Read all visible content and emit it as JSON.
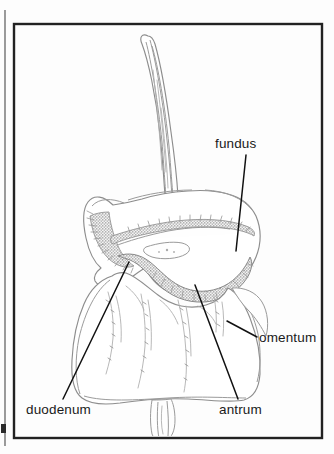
{
  "figure": {
    "style": "pen-and-ink medical illustration",
    "background_color": "#fdfdfd",
    "ink_color": "#8d8d8d",
    "label_color": "#1a1a1a",
    "frame_color": "#222222"
  },
  "frame": {
    "x": 14,
    "y": 24,
    "width": 308,
    "height": 414,
    "stroke_width": 2.4,
    "margin_rule_x": 5
  },
  "labels": [
    {
      "id": "fundus",
      "text": "fundus",
      "text_x": 215,
      "text_y": 148,
      "anchor": "start",
      "leader": {
        "x1": 246,
        "y1": 155,
        "x2": 236,
        "y2": 251
      }
    },
    {
      "id": "omentum",
      "text": "omentum",
      "text_x": 259,
      "text_y": 342,
      "anchor": "start",
      "leader": {
        "x1": 227,
        "y1": 321,
        "x2": 257,
        "y2": 337
      }
    },
    {
      "id": "duodenum",
      "text": "duodenum",
      "text_x": 26,
      "text_y": 414,
      "anchor": "start",
      "leader": {
        "x1": 129,
        "y1": 262,
        "x2": 63,
        "y2": 399
      }
    },
    {
      "id": "antrum",
      "text": "antrum",
      "text_x": 219,
      "text_y": 414,
      "anchor": "start",
      "leader": {
        "x1": 195,
        "y1": 285,
        "x2": 238,
        "y2": 399
      }
    }
  ],
  "anatomy_parts": [
    {
      "name": "esophagus",
      "description": "curved tube entering from top, hooking left at its free end"
    },
    {
      "name": "fundus",
      "description": "rounded upper-left dome of the stomach"
    },
    {
      "name": "body",
      "description": "main stomach chamber with greater curvature below"
    },
    {
      "name": "antrum",
      "description": "lower distal stomach portion before the pylorus"
    },
    {
      "name": "duodenum",
      "description": "notched junction at the left of the greater curvature"
    },
    {
      "name": "omentum",
      "description": "broad apron of fatty tissue draping below the stomach"
    },
    {
      "name": "greater-curvature-band",
      "description": "heavily stippled shaded band along the lower stomach margin"
    }
  ]
}
